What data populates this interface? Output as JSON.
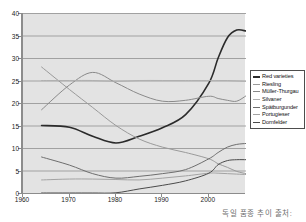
{
  "caption": "독일 품종 추이 출처:",
  "colors": {
    "plot_background": "#e3e3e3",
    "grid": "#9a9a9a",
    "axis": "#8c8c8c",
    "red_varieties": "#2b2b2b",
    "riesling": "#9a9a9a",
    "muller_thurgau": "#8a8a8a",
    "silvaner": "#b0b0b0",
    "spatburgunder": "#6e6e6e",
    "portugieser": "#a3a3a3",
    "dornfelder": "#4a4a4a"
  },
  "axes": {
    "y_ticks": [
      "0",
      "5",
      "10",
      "15",
      "20",
      "25",
      "30",
      "35",
      "40"
    ],
    "x_ticks": [
      "1960",
      "1970",
      "1980",
      "1990",
      "2000"
    ]
  },
  "legend": {
    "items": [
      {
        "label": "Red varieties"
      },
      {
        "label": "Riesling"
      },
      {
        "label": "Müller-Thurgau"
      },
      {
        "label": "Silvaner"
      },
      {
        "label": "Spätburgunder"
      },
      {
        "label": "Portugieser"
      },
      {
        "label": "Dornfelder"
      }
    ]
  },
  "chart_data": {
    "type": "line",
    "title": "",
    "xlabel": "",
    "ylabel": "",
    "xlim": [
      1960,
      2008
    ],
    "ylim": [
      0,
      40
    ],
    "grid": true,
    "legend_position": "right",
    "x": [
      1964,
      1970,
      1975,
      1980,
      1985,
      1990,
      1995,
      2000,
      2002,
      2004,
      2006,
      2008
    ],
    "series": [
      {
        "name": "Red varieties",
        "color": "#2b2b2b",
        "values": [
          15.0,
          14.6,
          12.6,
          11.1,
          12.6,
          14.5,
          17.4,
          24.4,
          30.0,
          34.5,
          36.2,
          36.0
        ]
      },
      {
        "name": "Riesling",
        "color": "#9a9a9a",
        "values": [
          28.0,
          23.0,
          19.0,
          15.0,
          12.0,
          10.2,
          9.0,
          7.6,
          6.5,
          5.7,
          4.8,
          4.3
        ]
      },
      {
        "name": "Müller-Thurgau",
        "color": "#8a8a8a",
        "values": [
          18.5,
          24.0,
          26.8,
          24.5,
          22.0,
          20.4,
          20.6,
          21.5,
          21.0,
          20.6,
          20.4,
          21.6
        ]
      },
      {
        "name": "Silvaner",
        "color": "#b0b0b0",
        "values": [
          25.0,
          25.0,
          25.0,
          24.8,
          25.0,
          25.0,
          25.0,
          25.0,
          25.0,
          25.0,
          24.9,
          24.8
        ]
      },
      {
        "name": "Spätburgunder",
        "color": "#6e6e6e",
        "values": [
          8.0,
          6.2,
          4.3,
          3.3,
          3.7,
          4.3,
          5.2,
          7.6,
          9.0,
          10.2,
          10.8,
          11.0
        ]
      },
      {
        "name": "Portugieser",
        "color": "#a3a3a3",
        "values": [
          2.9,
          3.1,
          3.1,
          3.0,
          2.9,
          3.3,
          3.8,
          4.4,
          4.4,
          4.3,
          4.2,
          4.1
        ]
      },
      {
        "name": "Dornfelder",
        "color": "#4a4a4a",
        "values": [
          0.0,
          0.0,
          0.0,
          0.05,
          0.9,
          1.7,
          2.7,
          4.4,
          6.3,
          7.2,
          7.4,
          7.4
        ]
      }
    ]
  }
}
